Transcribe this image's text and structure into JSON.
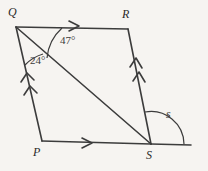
{
  "figure": {
    "background_color": "#f6f4f1",
    "stroke_color": "#3c3c3c",
    "vertices": [
      {
        "name": "Q",
        "label": "Q",
        "x": 16,
        "y": 27,
        "label_x": 8,
        "label_y": 6
      },
      {
        "name": "R",
        "label": "R",
        "x": 128,
        "y": 29,
        "label_x": 122,
        "label_y": 8
      },
      {
        "name": "P",
        "label": "P",
        "x": 42,
        "y": 141,
        "label_x": 33,
        "label_y": 146
      },
      {
        "name": "S",
        "label": "S",
        "x": 151,
        "y": 144,
        "label_x": 146,
        "label_y": 149
      }
    ],
    "segments": [
      {
        "name": "QR",
        "from": "Q",
        "to": "R",
        "ticks": 1,
        "tick_direction": "toward-R"
      },
      {
        "name": "QP",
        "from": "Q",
        "to": "P",
        "ticks": 2,
        "tick_direction": "toward-Q"
      },
      {
        "name": "RS",
        "from": "R",
        "to": "S",
        "ticks": 2,
        "tick_direction": "toward-R"
      },
      {
        "name": "PS",
        "from": "P",
        "to": "S",
        "ticks": 1,
        "tick_direction": "toward-S"
      },
      {
        "name": "QS",
        "from": "Q",
        "to": "S",
        "ticks": 0,
        "tick_direction": "none"
      },
      {
        "name": "S-extension",
        "from": "S",
        "to": "right-edge",
        "ticks": 0,
        "tick_direction": "none"
      }
    ],
    "angles": [
      {
        "name": "angle-RQS",
        "label": "47°",
        "value": 47,
        "unit": "degrees",
        "at_vertex": "Q",
        "label_x": 60,
        "label_y": 35
      },
      {
        "name": "angle-SQP",
        "label": "24°",
        "value": 24,
        "unit": "degrees",
        "at_vertex": "Q",
        "label_x": 30,
        "label_y": 55
      },
      {
        "name": "angle-s-exterior",
        "label": "s",
        "value": null,
        "unit": "variable",
        "at_vertex": "S",
        "label_x": 166,
        "label_y": 108
      }
    ]
  }
}
